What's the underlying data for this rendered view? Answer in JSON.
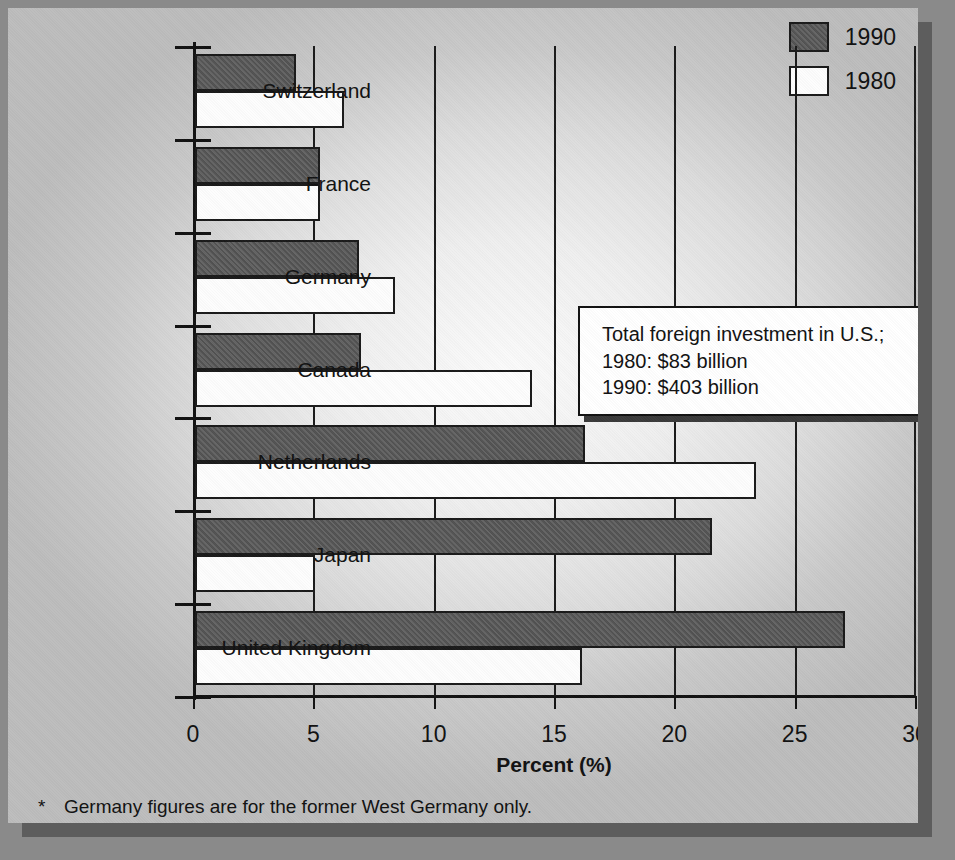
{
  "chart_data": {
    "type": "bar",
    "orientation": "horizontal",
    "title": "",
    "xlabel": "Percent (%)",
    "ylabel": "",
    "xlim": [
      0,
      30
    ],
    "xticks": [
      "0",
      "5",
      "10",
      "15",
      "20",
      "25",
      "30"
    ],
    "grid": true,
    "legend_position": "top-right",
    "categories": [
      "Switzerland",
      "France",
      "Germany",
      "Canada",
      "Netherlands",
      "Japan",
      "United Kingdom"
    ],
    "series": [
      {
        "name": "1990",
        "color": "#585858",
        "values": [
          4.2,
          5.2,
          6.8,
          6.9,
          16.2,
          21.5,
          27.0
        ]
      },
      {
        "name": "1980",
        "color": "#FDFDFD",
        "values": [
          6.2,
          5.2,
          8.3,
          14.0,
          23.3,
          5.0,
          16.1
        ]
      }
    ],
    "annotation": {
      "line1": "Total foreign investment in U.S.;",
      "line2": "1980: $83 billion",
      "line3": "1990: $403 billion"
    },
    "footnote": {
      "marker": "*",
      "text": "Germany figures are for the former West Germany only."
    }
  }
}
